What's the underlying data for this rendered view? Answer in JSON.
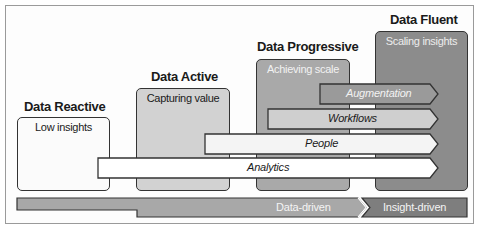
{
  "diagram": {
    "type": "data-maturity-stages",
    "stages": [
      {
        "title": "Data Reactive",
        "subtitle": "Low insights",
        "fill": "#fbfbfb",
        "subtitle_color": "#1a1a1a"
      },
      {
        "title": "Data Active",
        "subtitle": "Capturing value",
        "fill": "#d2d2d2",
        "subtitle_color": "#1a1a1a"
      },
      {
        "title": "Data Progressive",
        "subtitle": "Achieving scale",
        "fill": "#a9a9a9",
        "subtitle_color": "#f2f2f2"
      },
      {
        "title": "Data Fluent",
        "subtitle": "Scaling insights",
        "fill": "#8c8c8c",
        "subtitle_color": "#ececec"
      }
    ],
    "capabilities": [
      {
        "label": "Augmentation",
        "fill": "#9a9a9a",
        "text_color": "#f2f2f2"
      },
      {
        "label": "Workflows",
        "fill": "#cfcfcf",
        "text_color": "#1a1a1a"
      },
      {
        "label": "People",
        "fill": "#f4f4f4",
        "text_color": "#1a1a1a"
      },
      {
        "label": "Analytics",
        "fill": "#ffffff",
        "text_color": "#1a1a1a"
      }
    ],
    "progression": [
      {
        "label": "Data-driven",
        "fill": "#a8a8a8"
      },
      {
        "label": "Insight-driven",
        "fill": "#7e7e7e"
      }
    ],
    "colors": {
      "stroke": "#333333",
      "frame": "#9a9a9a"
    }
  }
}
